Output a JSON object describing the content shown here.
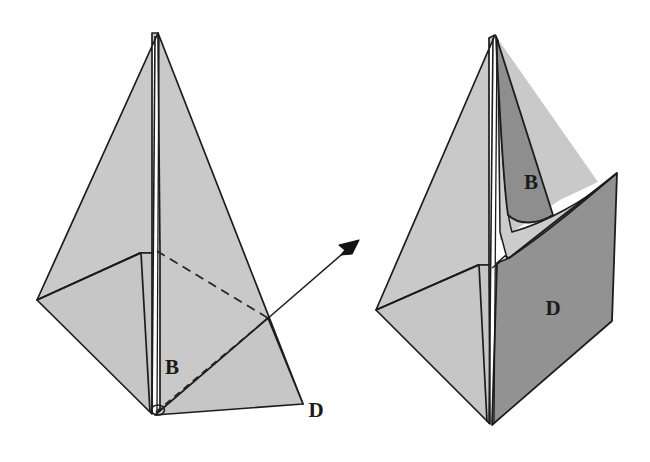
{
  "figure": {
    "background_color": "#ffffff",
    "colors": {
      "light_face": "#c7c7c7",
      "light_face_alt": "#c0c0c0",
      "dark_face": "#8e8e8e",
      "dark_face_alt": "#949494",
      "outline": "#1c1c1c",
      "dashed_line": "#2a2a2a",
      "arrow": "#1a1a1a",
      "label_text": "#1a1a1a"
    },
    "panels": [
      {
        "id": "left-figure",
        "name": "closed-tetrahedral-shape",
        "labels": [
          {
            "id": "left-label-b",
            "text": "B",
            "x": 172,
            "y": 374
          },
          {
            "id": "left-label-d",
            "text": "D",
            "x": 313,
            "y": 416
          }
        ],
        "dashed_edges": 2,
        "description": "Spire-like folded sheet with hidden edges shown dashed"
      },
      {
        "id": "right-figure",
        "name": "opened-tetrahedral-shape",
        "labels": [
          {
            "id": "right-label-b",
            "text": "B",
            "x": 531,
            "y": 182
          },
          {
            "id": "right-label-d",
            "text": "D",
            "x": 552,
            "y": 308
          }
        ],
        "dashed_edges": 0,
        "description": "Same sheet with flaps B and D swung open, curved fold visible"
      }
    ],
    "arrow": {
      "id": "transform-arrow",
      "name": "transform-arrow",
      "from": {
        "x": 268,
        "y": 319
      },
      "to": {
        "x": 357,
        "y": 242
      },
      "head_size": 13,
      "direction": "up-right"
    }
  }
}
